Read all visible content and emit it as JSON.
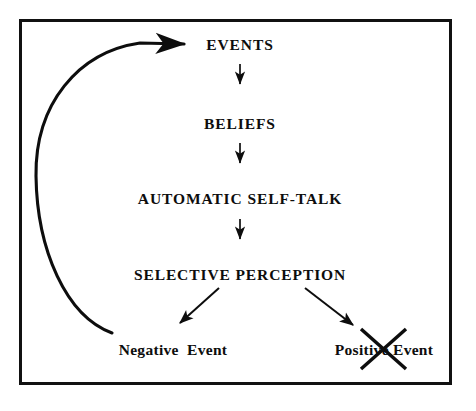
{
  "diagram": {
    "frame": {
      "stroke_color": "#111111",
      "background": "#ffffff"
    },
    "stroke_color": "#0d0d0d",
    "nodes": [
      {
        "id": "events",
        "label": "EVENTS",
        "style": "caps",
        "x": 240,
        "y": 45
      },
      {
        "id": "beliefs",
        "label": "BELIEFS",
        "style": "caps",
        "x": 240,
        "y": 124
      },
      {
        "id": "self_talk",
        "label": "AUTOMATIC SELF-TALK",
        "style": "caps",
        "x": 240,
        "y": 199
      },
      {
        "id": "selective_perception",
        "label": "SELECTIVE PERCEPTION",
        "style": "caps",
        "x": 240,
        "y": 275
      },
      {
        "id": "negative_event",
        "label": "Negative  Event",
        "style": "title",
        "x": 173,
        "y": 350
      },
      {
        "id": "positive_event",
        "label": "Positive Event",
        "style": "title",
        "x": 384,
        "y": 350
      }
    ],
    "connectors": [
      {
        "id": "events-to-beliefs",
        "type": "arrow-down",
        "from": "events",
        "to": "beliefs"
      },
      {
        "id": "beliefs-to-self-talk",
        "type": "arrow-down",
        "from": "beliefs",
        "to": "self_talk"
      },
      {
        "id": "self-talk-to-selective-perception",
        "type": "arrow-down",
        "from": "self_talk",
        "to": "selective_perception"
      },
      {
        "id": "selective-perception-to-negative-event",
        "type": "arrow-diagonal-left",
        "from": "selective_perception",
        "to": "negative_event"
      },
      {
        "id": "selective-perception-to-positive-event",
        "type": "arrow-diagonal-right",
        "from": "selective_perception",
        "to": "positive_event"
      },
      {
        "id": "negative-event-to-events",
        "type": "arrow-curved-feedback",
        "from": "negative_event",
        "to": "events"
      }
    ],
    "annotations": [
      {
        "id": "positive-event-crossout",
        "type": "x-strikeout",
        "target": "positive_event"
      }
    ]
  }
}
